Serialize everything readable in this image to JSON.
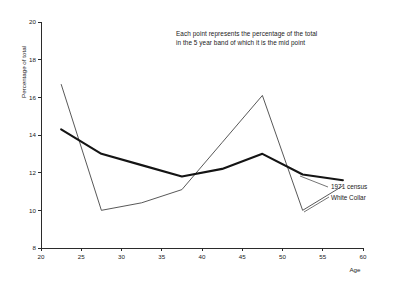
{
  "annotation": {
    "line1": "Each point represents the percentage of the total",
    "line2": "in the 5 year band of which it is the mid point"
  },
  "labels": {
    "series_1971": "1971 census",
    "series_white_collar": "White Collar"
  },
  "chart_data": {
    "type": "line",
    "title": "",
    "xlabel": "Age",
    "ylabel": "Percentage of total",
    "xlim": [
      20,
      60
    ],
    "ylim": [
      8,
      20
    ],
    "xticks": [
      20,
      25,
      30,
      35,
      40,
      45,
      50,
      55,
      60
    ],
    "yticks": [
      8,
      10,
      12,
      14,
      16,
      18,
      20
    ],
    "grid": false,
    "legend_position": "right-inline-labels",
    "annotations": [
      "Each point represents the percentage of the total",
      "in the 5 year band of which it is the mid point"
    ],
    "x": [
      22.5,
      27.5,
      32.5,
      37.5,
      42.5,
      47.5,
      52.5,
      57.5
    ],
    "series": [
      {
        "name": "1971 census",
        "style": "thick",
        "color": "#141414",
        "values": [
          14.3,
          13.0,
          12.4,
          11.8,
          12.2,
          13.0,
          11.9,
          11.6
        ]
      },
      {
        "name": "White Collar",
        "style": "thin",
        "color": "#3a3a3a",
        "values": [
          16.7,
          10.0,
          10.4,
          11.1,
          13.6,
          16.1,
          10.0,
          11.3
        ]
      }
    ]
  }
}
